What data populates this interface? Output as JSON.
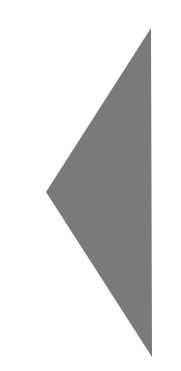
{
  "shape": {
    "type": "triangle",
    "direction": "left",
    "points": [
      [
        151,
        28
      ],
      [
        46,
        192
      ],
      [
        152,
        357
      ]
    ],
    "fill": "#7a7a7a"
  }
}
